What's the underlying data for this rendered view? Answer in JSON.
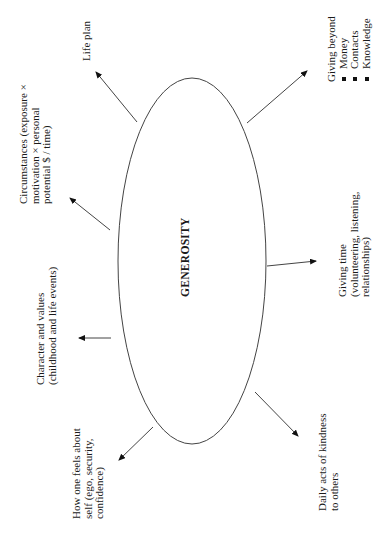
{
  "diagram": {
    "center": {
      "label": "GENEROSITY"
    },
    "nodes": [
      {
        "id": "life-plan",
        "lines": [
          "Life plan"
        ]
      },
      {
        "id": "circumstances",
        "lines": [
          "Circumstances (exposure ×",
          "motivation ×  personal",
          "potential $ / time)"
        ]
      },
      {
        "id": "character",
        "lines": [
          "Character and values",
          "(childhood and life events)"
        ]
      },
      {
        "id": "self-feeling",
        "lines": [
          "How one feels about",
          "self (ego, security,",
          "confidence)"
        ]
      },
      {
        "id": "daily-acts",
        "lines": [
          "Daily acts of kindness",
          "to others"
        ]
      },
      {
        "id": "giving-time",
        "lines": [
          "Giving time",
          "(volunteering, listening,",
          "relationships)"
        ]
      },
      {
        "id": "giving-beyond",
        "title": "Giving beyond",
        "items": [
          "Money",
          "Contacts",
          "Knowledge"
        ]
      }
    ],
    "colors": {
      "line": "#444444",
      "text": "#1a1a1a",
      "background": "#ffffff"
    }
  }
}
